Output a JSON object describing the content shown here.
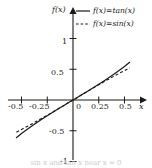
{
  "figure": {
    "background": "#ffffff",
    "axis_color": "#1a1a1a",
    "curve_color": "#1a1a1a"
  },
  "axes": {
    "y_axis_label": "f(x)",
    "x_axis_label": "x",
    "x_tick_labels": [
      "-0.5",
      "-0.25",
      "0",
      "0.25",
      "0.5"
    ],
    "y_tick_labels": [
      "1",
      "0.5",
      "-0.5",
      "-1"
    ]
  },
  "legend": {
    "entries": [
      {
        "label": "f(x)=tan(x)",
        "style": "solid"
      },
      {
        "label": "f(x)=sin(x)",
        "style": "dashed"
      }
    ]
  },
  "caption": {
    "text": "sin x and tan x near x = 0"
  },
  "chart_data": {
    "type": "line",
    "title": "",
    "xlabel": "x",
    "ylabel": "f(x)",
    "xlim": [
      -0.62,
      0.62
    ],
    "ylim": [
      -1.12,
      1.12
    ],
    "grid": false,
    "legend_position": "top-right",
    "x_ticks": [
      -0.5,
      -0.25,
      0,
      0.25,
      0.5
    ],
    "y_ticks": [
      1,
      0.5,
      -0.5,
      -1
    ],
    "x_domain_drawn": [
      -0.55,
      0.55
    ],
    "series": [
      {
        "name": "f(x)=tan(x)",
        "style": "solid",
        "x": [
          -0.55,
          -0.5,
          -0.45,
          -0.4,
          -0.35,
          -0.3,
          -0.25,
          -0.2,
          -0.15,
          -0.1,
          -0.05,
          0,
          0.05,
          0.1,
          0.15,
          0.2,
          0.25,
          0.3,
          0.35,
          0.4,
          0.45,
          0.5,
          0.55
        ],
        "values": [
          -0.613,
          -0.546,
          -0.483,
          -0.423,
          -0.365,
          -0.309,
          -0.255,
          -0.203,
          -0.151,
          -0.1,
          -0.05,
          0,
          0.05,
          0.1,
          0.151,
          0.203,
          0.255,
          0.309,
          0.365,
          0.423,
          0.483,
          0.546,
          0.613
        ]
      },
      {
        "name": "f(x)=sin(x)",
        "style": "dashed",
        "x": [
          -0.55,
          -0.5,
          -0.45,
          -0.4,
          -0.35,
          -0.3,
          -0.25,
          -0.2,
          -0.15,
          -0.1,
          -0.05,
          0,
          0.05,
          0.1,
          0.15,
          0.2,
          0.25,
          0.3,
          0.35,
          0.4,
          0.45,
          0.5,
          0.55
        ],
        "values": [
          -0.523,
          -0.479,
          -0.435,
          -0.389,
          -0.343,
          -0.296,
          -0.247,
          -0.199,
          -0.149,
          -0.1,
          -0.05,
          0,
          0.05,
          0.1,
          0.149,
          0.199,
          0.247,
          0.296,
          0.343,
          0.389,
          0.435,
          0.479,
          0.523
        ]
      }
    ]
  }
}
